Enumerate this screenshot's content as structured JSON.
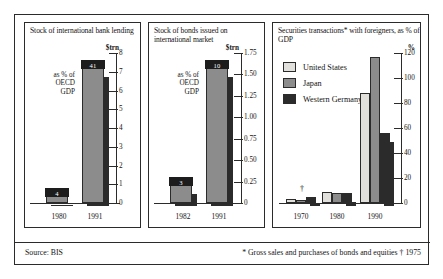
{
  "figure": {
    "source": "Source: BIS",
    "footnote": "* Gross sales and purchases of bonds and equities  † 1975"
  },
  "chart_data": [
    {
      "type": "bar",
      "panel": 1,
      "title": "Stock of international bank lending",
      "ylabel": "$trn",
      "xlabel": "",
      "categories": [
        "1980",
        "1991"
      ],
      "values": [
        0.35,
        7.2
      ],
      "ylim": [
        0,
        8
      ],
      "yticks": [
        0,
        1,
        2,
        3,
        4,
        5,
        6,
        7,
        8
      ],
      "ytick_labels": [
        "0",
        "1",
        "2",
        "3",
        "4",
        "5",
        "6",
        "7",
        "8"
      ],
      "annotation": "as % of OECD GDP",
      "data_labels": [
        "4",
        "41"
      ],
      "grid": false,
      "legend": "none"
    },
    {
      "type": "bar",
      "panel": 2,
      "title": "Stock of bonds issued on international market",
      "ylabel": "$trn",
      "xlabel": "",
      "categories": [
        "1982",
        "1991"
      ],
      "values": [
        0.21,
        1.57
      ],
      "ylim": [
        0,
        1.75
      ],
      "yticks": [
        0,
        0.25,
        0.5,
        0.75,
        1.0,
        1.25,
        1.5,
        1.75
      ],
      "ytick_labels": [
        "0",
        "0.25",
        "0.50",
        "0.75",
        "1.00",
        "1.25",
        "1.50",
        "1.75"
      ],
      "annotation": "as % of OECD GDP",
      "data_labels": [
        "3",
        "10"
      ],
      "grid": false,
      "legend": "none"
    },
    {
      "type": "bar",
      "panel": 3,
      "title": "Securities transactions* with foreigners, as % of GDP",
      "ylabel": "%",
      "xlabel": "",
      "categories": [
        "1970",
        "1980",
        "1990"
      ],
      "series": [
        {
          "name": "United States",
          "values": [
            3,
            9,
            88
          ]
        },
        {
          "name": "Japan",
          "values": [
            2,
            8,
            117
          ]
        },
        {
          "name": "Western Germany",
          "values": [
            5,
            8,
            56
          ]
        }
      ],
      "ylim": [
        0,
        120
      ],
      "yticks": [
        0,
        20,
        40,
        60,
        80,
        100,
        120
      ],
      "ytick_labels": [
        "0",
        "20",
        "40",
        "60",
        "80",
        "100",
        "120"
      ],
      "marker_note": "†",
      "grid": false,
      "legend": "inside-top-left"
    }
  ],
  "colors": {
    "light": "#e2e0db",
    "mid": "#8c8c8c",
    "dark": "#2b2b2b",
    "ink": "#141414",
    "background": "#ffffff"
  }
}
